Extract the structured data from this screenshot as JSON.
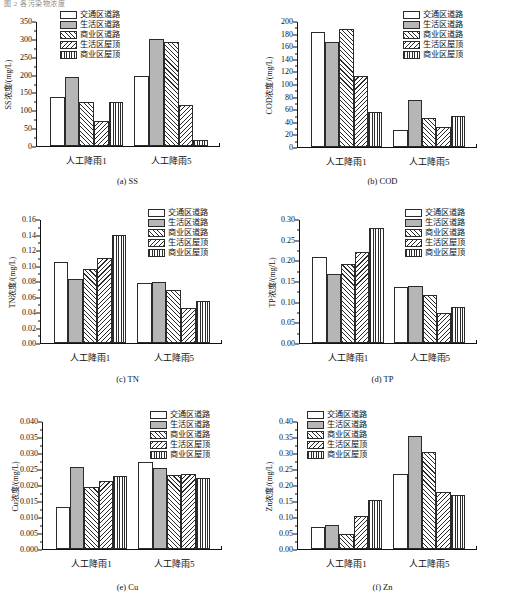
{
  "clipped_header_text": "图 2  各污染物浓度",
  "legend_labels": [
    "交通区道路",
    "生活区道路",
    "商业区道路",
    "生活区屋顶",
    "商业区屋顶"
  ],
  "legend_patterns": [
    "white",
    "gray",
    "forward-hatch",
    "back-hatch",
    "vertical-lines"
  ],
  "categories": [
    "人工降雨1",
    "人工降雨5"
  ],
  "chart_data": [
    {
      "type": "bar",
      "panel": "a",
      "caption": "(a)  SS",
      "title": "",
      "ylabel": "SS浓度/(mg/L)",
      "xlabel": "",
      "categories": [
        "人工降雨1",
        "人工降雨5"
      ],
      "ylim": [
        0,
        350
      ],
      "yticks": [
        0,
        50,
        100,
        150,
        200,
        250,
        300,
        350
      ],
      "ytick_labels": [
        "0",
        "50",
        "100",
        "150",
        "200",
        "250",
        "300",
        "350"
      ],
      "grid": false,
      "legend_position": "top-center",
      "series": [
        {
          "name": "交通区道路",
          "values": [
            136,
            195
          ]
        },
        {
          "name": "生活区道路",
          "values": [
            192,
            299
          ]
        },
        {
          "name": "商业区道路",
          "values": [
            122,
            292
          ]
        },
        {
          "name": "生活区屋顶",
          "values": [
            69,
            116
          ]
        },
        {
          "name": "商业区屋顶",
          "values": [
            124,
            17
          ]
        }
      ]
    },
    {
      "type": "bar",
      "panel": "b",
      "caption": "(b)  COD",
      "title": "",
      "ylabel": "COD浓度/(mg/L)",
      "xlabel": "",
      "categories": [
        "人工降雨1",
        "人工降雨5"
      ],
      "ylim": [
        0,
        200
      ],
      "yticks": [
        0,
        20,
        40,
        60,
        80,
        100,
        120,
        140,
        160,
        180,
        200
      ],
      "ytick_labels": [
        "0",
        "20",
        "40",
        "60",
        "80",
        "100",
        "120",
        "140",
        "160",
        "180",
        "200"
      ],
      "grid": false,
      "legend_position": "top-right",
      "series": [
        {
          "name": "交通区道路",
          "values": [
            182,
            27
          ]
        },
        {
          "name": "生活区道路",
          "values": [
            167,
            75
          ]
        },
        {
          "name": "商业区道路",
          "values": [
            187,
            46
          ]
        },
        {
          "name": "生活区屋顶",
          "values": [
            113,
            32
          ]
        },
        {
          "name": "商业区屋顶",
          "values": [
            56,
            50
          ]
        }
      ]
    },
    {
      "type": "bar",
      "panel": "c",
      "caption": "(c)  TN",
      "title": "",
      "ylabel": "TN浓度/(mg/L)",
      "xlabel": "",
      "categories": [
        "人工降雨1",
        "人工降雨5"
      ],
      "ylim": [
        0,
        0.16
      ],
      "yticks": [
        0,
        0.02,
        0.04,
        0.06,
        0.08,
        0.1,
        0.12,
        0.14,
        0.16
      ],
      "ytick_labels": [
        "0.00",
        "0.02",
        "0.04",
        "0.06",
        "0.08",
        "0.10",
        "0.12",
        "0.14",
        "0.16"
      ],
      "grid": false,
      "legend_position": "top-right",
      "series": [
        {
          "name": "交通区道路",
          "values": [
            0.104,
            0.078
          ]
        },
        {
          "name": "生活区道路",
          "values": [
            0.083,
            0.079
          ]
        },
        {
          "name": "商业区道路",
          "values": [
            0.095,
            0.068
          ]
        },
        {
          "name": "生活区屋顶",
          "values": [
            0.11,
            0.045
          ]
        },
        {
          "name": "商业区屋顶",
          "values": [
            0.139,
            0.054
          ]
        }
      ]
    },
    {
      "type": "bar",
      "panel": "d",
      "caption": "(d)  TP",
      "title": "",
      "ylabel": "TP浓度/(mg/L)",
      "xlabel": "",
      "categories": [
        "人工降雨1",
        "人工降雨5"
      ],
      "ylim": [
        0,
        0.3
      ],
      "yticks": [
        0,
        0.05,
        0.1,
        0.15,
        0.2,
        0.25,
        0.3
      ],
      "ytick_labels": [
        "0.00",
        "0.05",
        "0.10",
        "0.15",
        "0.20",
        "0.25",
        "0.30"
      ],
      "grid": false,
      "legend_position": "top-right",
      "series": [
        {
          "name": "交通区道路",
          "values": [
            0.209,
            0.136
          ]
        },
        {
          "name": "生活区道路",
          "values": [
            0.167,
            0.138
          ]
        },
        {
          "name": "商业区道路",
          "values": [
            0.191,
            0.117
          ]
        },
        {
          "name": "生活区屋顶",
          "values": [
            0.22,
            0.072
          ]
        },
        {
          "name": "商业区屋顶",
          "values": [
            0.279,
            0.088
          ]
        }
      ]
    },
    {
      "type": "bar",
      "panel": "e",
      "caption": "(e)  Cu",
      "title": "",
      "ylabel": "Cu浓度/(mg/L)",
      "xlabel": "",
      "categories": [
        "人工降雨1",
        "人工降雨5"
      ],
      "ylim": [
        0,
        0.04
      ],
      "yticks": [
        0,
        0.005,
        0.01,
        0.015,
        0.02,
        0.025,
        0.03,
        0.035,
        0.04
      ],
      "ytick_labels": [
        "0.000",
        "0.005",
        "0.010",
        "0.015",
        "0.020",
        "0.025",
        "0.030",
        "0.035",
        "0.040"
      ],
      "grid": false,
      "legend_position": "top-right",
      "series": [
        {
          "name": "交通区道路",
          "values": [
            0.013,
            0.0271
          ]
        },
        {
          "name": "生活区道路",
          "values": [
            0.0256,
            0.0253
          ]
        },
        {
          "name": "商业区道路",
          "values": [
            0.0194,
            0.0231
          ]
        },
        {
          "name": "生活区屋顶",
          "values": [
            0.0212,
            0.0235
          ]
        },
        {
          "name": "商业区屋顶",
          "values": [
            0.0228,
            0.0222
          ]
        }
      ]
    },
    {
      "type": "bar",
      "panel": "f",
      "caption": "(f)  Zn",
      "title": "",
      "ylabel": "Zn浓度/(mg/L)",
      "xlabel": "",
      "categories": [
        "人工降雨1",
        "人工降雨5"
      ],
      "ylim": [
        0,
        0.4
      ],
      "yticks": [
        0,
        0.05,
        0.1,
        0.15,
        0.2,
        0.25,
        0.3,
        0.35,
        0.4
      ],
      "ytick_labels": [
        "0.00",
        "0.05",
        "0.10",
        "0.15",
        "0.20",
        "0.25",
        "0.30",
        "0.35",
        "0.40"
      ],
      "grid": false,
      "legend_position": "top-left",
      "series": [
        {
          "name": "交通区道路",
          "values": [
            0.068,
            0.235
          ]
        },
        {
          "name": "生活区道路",
          "values": [
            0.076,
            0.352
          ]
        },
        {
          "name": "商业区道路",
          "values": [
            0.047,
            0.303
          ]
        },
        {
          "name": "生活区屋顶",
          "values": [
            0.102,
            0.179
          ]
        },
        {
          "name": "商业区屋顶",
          "values": [
            0.154,
            0.168
          ]
        }
      ]
    }
  ]
}
